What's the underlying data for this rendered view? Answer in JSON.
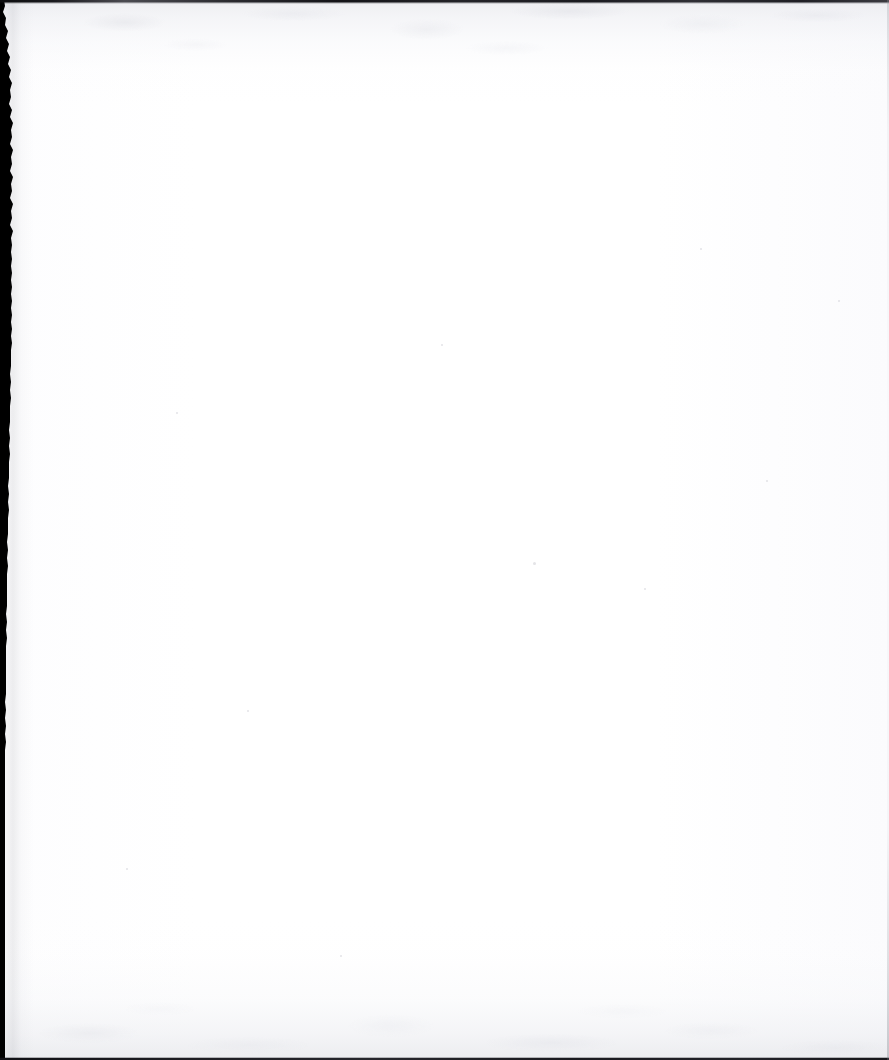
{
  "document": {
    "kind": "scanned-page",
    "content_text": "",
    "is_blank": true,
    "width_px": 889,
    "height_px": 1060
  },
  "colors": {
    "paper_white": "#ffffff",
    "paper_tint": "#fdfdfe",
    "mottle_grey": "#e4e5e9",
    "gutter_black": "#000000",
    "edge_line_dark": "#1a1a1e",
    "edge_line_right": "#c8c9cf",
    "speck_grey": "#cdced4"
  },
  "artifacts": {
    "left_gutter": {
      "name": "scanner-gutter",
      "description": "Ragged black scanner gutter along the left edge",
      "min_width_px": 3,
      "max_width_px": 12,
      "torn_edge_path": "M 0,0 L 4,0 L 5,6 L 3,12 L 6,18 L 5,25 L 8,31 L 6,38 L 9,44 L 7,51 L 10,57 L 8,64 L 11,70 L 9,77 L 12,83 L 10,90 L 11,97 L 9,104 L 12,110 L 10,117 L 13,123 L 11,130 L 12,137 L 10,144 L 13,150 L 11,157 L 12,164 L 10,171 L 13,177 L 11,184 L 12,191 L 10,198 L 13,204 L 11,211 L 12,218 L 10,225 L 13,231 L 11,238 L 12,245 L 11,252 L 12,259 L 11,266 L 12,273 L 11,280 L 12,287 L 11,294 L 12,301 L 11,308 L 12,315 L 11,322 L 12,329 L 11,336 L 12,343 L 11,350 L 11,358 L 11,366 L 10,374 L 11,382 L 10,390 L 11,398 L 10,406 L 10,414 L 10,422 L 9,430 L 10,438 L 9,446 L 10,454 L 9,462 L 9,470 L 9,478 L 8,486 L 9,494 L 8,502 L 9,510 L 8,518 L 8,526 L 8,534 L 7,542 L 8,550 L 7,558 L 8,566 L 7,574 L 7,582 L 7,590 L 7,598 L 7,606 L 6,614 L 7,622 L 6,630 L 7,638 L 6,646 L 6,654 L 6,662 L 6,670 L 6,678 L 6,686 L 6,694 L 5,702 L 6,710 L 5,718 L 6,726 L 5,734 L 6,742 L 5,750 L 5,760 L 5,770 L 5,780 L 5,790 L 5,800 L 5,810 L 5,820 L 5,830 L 5,840 L 5,850 L 5,860 L 5,870 L 5,880 L 5,890 L 5,900 L 5,910 L 5,920 L 5,930 L 5,940 L 5,950 L 5,960 L 5,970 L 5,980 L 5,990 L 5,1000 L 5,1010 L 5,1020 L 5,1030 L 5,1040 L 5,1050 L 5,1060 L 0,1060 Z"
    },
    "top_edge_line": {
      "name": "top-edge-line",
      "description": "Thin irregular dark line along the top edge",
      "thickness_px": 3
    },
    "bottom_edge_line": {
      "name": "bottom-edge-line",
      "description": "Thin dark line along the bottom edge",
      "thickness_px": 2
    },
    "right_edge_line": {
      "name": "right-edge-line",
      "description": "Faint grey tint along the right edge",
      "thickness_px": 2
    },
    "mottle_top": {
      "name": "scan-mottle-top",
      "description": "Faint grey scanner mottling across the upper band",
      "band_top_px": 0,
      "band_height_px": 86
    },
    "mottle_bottom": {
      "name": "scan-mottle-bottom",
      "description": "Faint grey scanner mottling across the lower band",
      "band_height_px": 122
    },
    "specks": [
      {
        "x": 176,
        "y": 412,
        "size": 2
      },
      {
        "x": 441,
        "y": 344,
        "size": 2
      },
      {
        "x": 766,
        "y": 480,
        "size": 2
      },
      {
        "x": 533,
        "y": 562,
        "size": 3
      },
      {
        "x": 644,
        "y": 588,
        "size": 2
      },
      {
        "x": 340,
        "y": 955,
        "size": 2
      },
      {
        "x": 838,
        "y": 300,
        "size": 2
      },
      {
        "x": 247,
        "y": 710,
        "size": 2
      },
      {
        "x": 700,
        "y": 248,
        "size": 2
      },
      {
        "x": 126,
        "y": 868,
        "size": 2
      }
    ]
  }
}
